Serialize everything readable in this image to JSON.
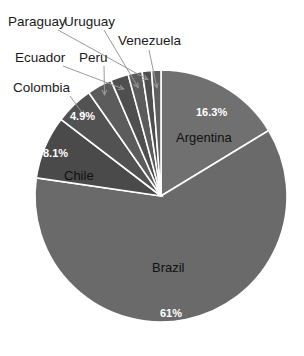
{
  "chart_data": {
    "type": "pie",
    "title": "",
    "subtitle": "",
    "xlabel": "",
    "ylabel": "",
    "legend_position": "none",
    "grid": false,
    "categories": [
      "Argentina",
      "Brazil",
      "Chile",
      "Colombia",
      "Peru",
      "Ecuador",
      "Uruguay",
      "Paraguay",
      "Venezuela"
    ],
    "values": [
      16.3,
      61,
      8.1,
      4.9,
      3.2,
      2.3,
      1.8,
      1.2,
      1.2
    ],
    "value_unit": "%",
    "slices": [
      {
        "label": "Argentina",
        "value": 16.3,
        "value_text": "16.3%",
        "color": "#707070",
        "label_placement": "inside",
        "label_color": "#111111",
        "pct_color": "#ffffff"
      },
      {
        "label": "Brazil",
        "value": 61,
        "value_text": "61%",
        "color": "#6a6a6a",
        "label_placement": "inside",
        "label_color": "#111111",
        "pct_color": "#ffffff"
      },
      {
        "label": "Chile",
        "value": 8.1,
        "value_text": "8.1%",
        "color": "#4a4a4a",
        "label_placement": "inside",
        "label_color": "#111111",
        "pct_color": "#ffffff"
      },
      {
        "label": "Colombia",
        "value": 4.9,
        "value_text": "4.9%",
        "color": "#525252",
        "label_placement": "outside",
        "label_color": "#1a1a1a",
        "pct_color": "#ffffff"
      },
      {
        "label": "Peru",
        "value": 3.2,
        "value_text": "",
        "color": "#5c5c5c",
        "label_placement": "outside",
        "label_color": "#1a1a1a",
        "pct_color": ""
      },
      {
        "label": "Ecuador",
        "value": 2.3,
        "value_text": "",
        "color": "#4f4f4f",
        "label_placement": "outside",
        "label_color": "#1a1a1a",
        "pct_color": ""
      },
      {
        "label": "Uruguay",
        "value": 1.8,
        "value_text": "",
        "color": "#5c5c5c",
        "label_placement": "outside",
        "label_color": "#1a1a1a",
        "pct_color": ""
      },
      {
        "label": "Paraguay",
        "value": 1.2,
        "value_text": "",
        "color": "#4f4f4f",
        "label_placement": "outside",
        "label_color": "#1a1a1a",
        "pct_color": ""
      },
      {
        "label": "Venezuela",
        "value": 1.2,
        "value_text": "",
        "color": "#5f5f5f",
        "label_placement": "outside",
        "label_color": "#1a1a1a",
        "pct_color": ""
      }
    ],
    "visible_text_labels": {
      "paraguay": "Paraguay",
      "uruguay": "Uruguay",
      "venezuela": "Venezuela",
      "ecuador": "Ecuador",
      "peru": "Peru",
      "colombia": "Colombia",
      "chile": "Chile",
      "argentina": "Argentina",
      "brazil": "Brazil"
    },
    "visible_percent_labels": {
      "argentina_pct": "16.3%",
      "brazil_pct": "61%",
      "chile_pct": "8.1%",
      "colombia_pct": "4.9%"
    },
    "background_color": "#ffffff",
    "slice_border_color": "#ffffff",
    "leader_line_color": "#9a9a9a"
  }
}
